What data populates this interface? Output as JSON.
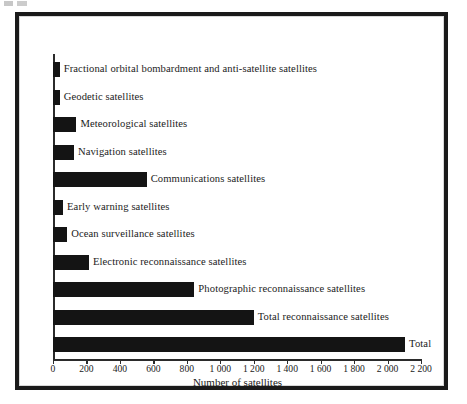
{
  "figure": {
    "artifact_name": "scan-artifact"
  },
  "chart_data": {
    "type": "bar",
    "orientation": "horizontal",
    "title": "",
    "xlabel": "Number of satellites",
    "ylabel": "",
    "xlim": [
      0,
      2200
    ],
    "xtick_step": 200,
    "grid": false,
    "legend": null,
    "bar_color": "#141414",
    "axis_color": "#2b2b2b",
    "xticks": [
      {
        "value": 0,
        "label": "0"
      },
      {
        "value": 200,
        "label": "200"
      },
      {
        "value": 400,
        "label": "400"
      },
      {
        "value": 600,
        "label": "600"
      },
      {
        "value": 800,
        "label": "800"
      },
      {
        "value": 1000,
        "label": "1 000"
      },
      {
        "value": 1200,
        "label": "1 200"
      },
      {
        "value": 1400,
        "label": "1 400"
      },
      {
        "value": 1600,
        "label": "1 600"
      },
      {
        "value": 1800,
        "label": "1 800"
      },
      {
        "value": 2000,
        "label": "2 000"
      },
      {
        "value": 2200,
        "label": "2 200"
      }
    ],
    "categories": [
      "Fractional orbital bombardment and anti-satellite satellites",
      "Geodetic satellites",
      "Meteorological satellites",
      "Navigation satellites",
      "Communications satellites",
      "Early warning satellites",
      "Ocean surveillance satellites",
      "Electronic reconnaissance satellites",
      "Photographic reconnaissance satellites",
      "Total reconnaissance satellites",
      "Total"
    ],
    "values": [
      40,
      40,
      140,
      125,
      560,
      60,
      85,
      215,
      845,
      1200,
      2105
    ]
  }
}
